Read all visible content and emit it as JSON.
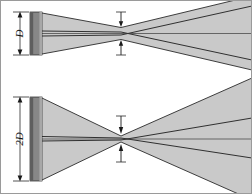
{
  "figure": {
    "background_color": "#ffffff",
    "border_color": "#9a9a9a",
    "width": 252,
    "height": 194
  },
  "palette": {
    "beam_fill": "#c9c9c9",
    "beam_edge": "#2a2a2a",
    "aperture_fill": "#878787",
    "aperture_shadow": "#5e5e5e",
    "aperture_highlight": "#a8a8a8",
    "line_color": "#1a1a1a",
    "axis_color": "#3a3a3a"
  },
  "panels": [
    {
      "id": "panel-small-aperture",
      "aperture_label": "D",
      "aperture_label_rotation": "-90",
      "waist_label": "",
      "description": "Small aperture of height D produces a comparatively large beam waist and a moderate far-field divergence.",
      "aperture": {
        "x": 30,
        "y": 12,
        "width": 12,
        "height": 43
      },
      "waist": {
        "x": 121,
        "half_height": 6
      },
      "divergence_half_angle_deg": "14"
    },
    {
      "id": "panel-large-aperture",
      "aperture_label": "2D",
      "aperture_label_rotation": "-90",
      "waist_label": "",
      "description": "Aperture of height 2D produces a smaller beam waist and a larger far-field divergence.",
      "aperture": {
        "x": 30,
        "y": 97,
        "width": 12,
        "height": 84
      },
      "waist": {
        "x": 121,
        "half_height": 3
      },
      "divergence_half_angle_deg": "26"
    }
  ],
  "annotations": {
    "dimension_line_name": "aperture-height-dimension",
    "waist_marker_name": "beam-waist-marker",
    "axis_name": "optical-axis"
  }
}
